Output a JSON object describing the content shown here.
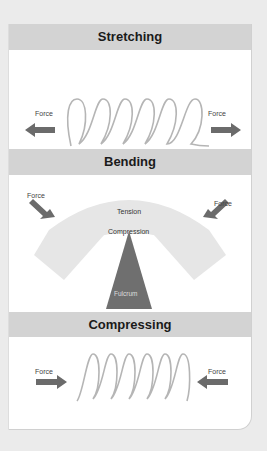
{
  "sections": [
    {
      "title": "Stretching",
      "left_label": "Force",
      "right_label": "Force"
    },
    {
      "title": "Bending",
      "left_label": "Force",
      "right_label": "Force",
      "top_label": "Tension",
      "mid_label": "Compression",
      "base_label": "Fulcrum"
    },
    {
      "title": "Compressing",
      "left_label": "Force",
      "right_label": "Force"
    }
  ],
  "colors": {
    "header": "#d3d3d3",
    "arrow": "#6b6b6b",
    "spring": "#b5b5b5",
    "beam": "#e3e3e3",
    "fulcrum": "#6f6f6f"
  }
}
